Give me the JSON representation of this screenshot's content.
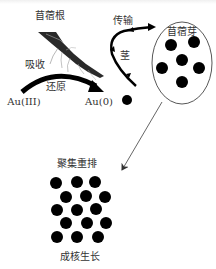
{
  "diagram": {
    "colors": {
      "ink": "#000000",
      "text": "#333333",
      "line": "#555555",
      "root": "#2a2a2a"
    },
    "labels": {
      "root": "苜蓿根",
      "absorb": "吸收",
      "reduce": "还原",
      "au3": "Au(III)",
      "au0": "Au(0)",
      "transport": "传输",
      "stem": "茎",
      "sprout": "苜蓿芽",
      "aggregate": "聚集重排",
      "nucleation": "成核生长"
    },
    "nodes": {
      "au0_dot": {
        "cx": 127,
        "cy": 100,
        "r": 5
      },
      "sprout_ellipse": {
        "cx": 182,
        "cy": 63,
        "rx": 30,
        "ry": 41
      },
      "sprout_dots": [
        {
          "cx": 171,
          "cy": 45
        },
        {
          "cx": 194,
          "cy": 42
        },
        {
          "cx": 182,
          "cy": 60
        },
        {
          "cx": 162,
          "cy": 68
        },
        {
          "cx": 199,
          "cy": 68
        },
        {
          "cx": 182,
          "cy": 82
        }
      ],
      "cluster_dots": [
        {
          "cx": 56,
          "cy": 183
        },
        {
          "cx": 77,
          "cy": 182
        },
        {
          "cx": 95,
          "cy": 182
        },
        {
          "cx": 66,
          "cy": 197
        },
        {
          "cx": 86,
          "cy": 196
        },
        {
          "cx": 105,
          "cy": 197
        },
        {
          "cx": 57,
          "cy": 210
        },
        {
          "cx": 77,
          "cy": 210
        },
        {
          "cx": 96,
          "cy": 209
        },
        {
          "cx": 66,
          "cy": 223
        },
        {
          "cx": 87,
          "cy": 223
        },
        {
          "cx": 106,
          "cy": 223
        },
        {
          "cx": 57,
          "cy": 237
        },
        {
          "cx": 77,
          "cy": 237
        },
        {
          "cx": 98,
          "cy": 237
        }
      ],
      "dot_radius": 6
    }
  }
}
